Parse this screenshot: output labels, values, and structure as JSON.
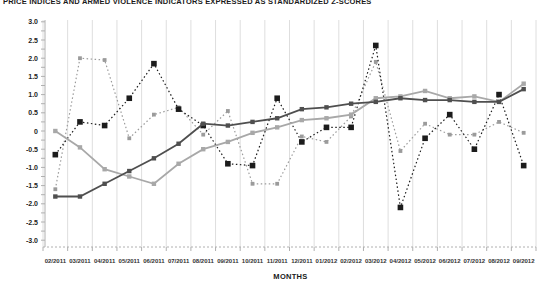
{
  "title": "PRICE INDICES AND ARMED VIOLENCE INDICATORS EXPRESSED AS STANDARDIZED Z-SCORES",
  "chart_data": {
    "type": "line",
    "title": "PRICE INDICES AND ARMED VIOLENCE INDICATORS EXPRESSED AS STANDARDIZED Z-SCORES",
    "xlabel": "MONTHS",
    "ylabel": "",
    "ylim": [
      -3.0,
      3.0
    ],
    "ytick_step": 0.5,
    "grid": "vertical-light-gridlines",
    "legend_visible": false,
    "yticks": [
      "3.0",
      "2.5",
      "2.0",
      "1.5",
      "1.0",
      "0.5",
      "0",
      "-0.5",
      "-1.0",
      "-1.5",
      "-2.0",
      "-2.5",
      "-3.0"
    ],
    "categories": [
      "02/2011",
      "03/2011",
      "04/2011",
      "05/2011",
      "06/2011",
      "07/2011",
      "08/2011",
      "09/2011",
      "10/2011",
      "11/2011",
      "12/2011",
      "01/2012",
      "02/2012",
      "03/2012",
      "04/2012",
      "05/2012",
      "06/2012",
      "07/2012",
      "08/2012",
      "09/2012"
    ],
    "series": [
      {
        "name": "gray dotted line",
        "style": "dotted",
        "color": "#9b9b9b",
        "marker": "square",
        "marker_size": 3.8,
        "values": [
          -1.6,
          2.0,
          1.95,
          -0.2,
          0.45,
          0.65,
          -0.1,
          0.55,
          -1.45,
          -1.45,
          -0.15,
          -0.3,
          0.4,
          1.9,
          -0.55,
          0.2,
          -0.1,
          -0.1,
          0.25,
          -0.05
        ]
      },
      {
        "name": "black dotted line",
        "style": "dotted",
        "color": "#1c1c1c",
        "marker": "square",
        "marker_size": 5.6,
        "values": [
          -0.65,
          0.25,
          0.15,
          0.9,
          1.85,
          0.6,
          0.15,
          -0.9,
          -0.95,
          0.9,
          -0.3,
          0.1,
          0.1,
          2.35,
          -2.1,
          -0.2,
          0.45,
          -0.5,
          1.0,
          -0.95
        ]
      },
      {
        "name": "light gray solid line",
        "style": "solid",
        "color": "#a8a8a8",
        "marker": "square",
        "marker_size": 4.4,
        "values": [
          0.0,
          -0.45,
          -1.05,
          -1.25,
          -1.45,
          -0.9,
          -0.5,
          -0.3,
          -0.05,
          0.1,
          0.3,
          0.35,
          0.45,
          0.9,
          0.95,
          1.1,
          0.9,
          0.95,
          0.8,
          1.3
        ]
      },
      {
        "name": "dark gray solid line",
        "style": "solid",
        "color": "#4f4f4f",
        "marker": "square",
        "marker_size": 4.4,
        "values": [
          -1.8,
          -1.8,
          -1.45,
          -1.1,
          -0.75,
          -0.35,
          0.2,
          0.15,
          0.25,
          0.35,
          0.6,
          0.65,
          0.75,
          0.8,
          0.9,
          0.85,
          0.85,
          0.8,
          0.8,
          1.15
        ]
      }
    ],
    "axis_color": "#b0b0b0",
    "gridline_color": "#dedede",
    "tick_label_color": "#333333"
  }
}
